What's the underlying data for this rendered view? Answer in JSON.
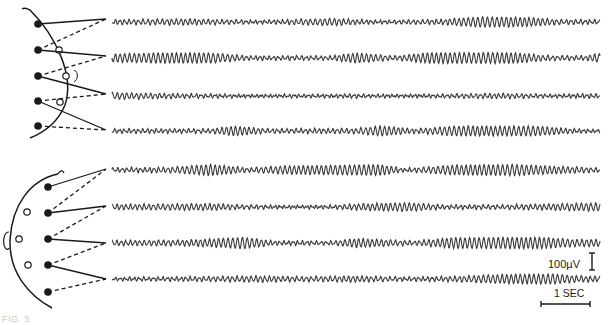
{
  "figure": {
    "panels": [
      {
        "id": "sagittal-montage",
        "view": "side profile",
        "active_electrodes": 5,
        "reference_electrodes": 3,
        "channels": [
          {
            "index": 1,
            "envelope": [
              [
                0,
                0.35
              ],
              [
                0.15,
                0.5
              ],
              [
                0.3,
                0.2
              ],
              [
                0.45,
                0.6
              ],
              [
                0.55,
                0.2
              ],
              [
                0.68,
                0.4
              ],
              [
                0.75,
                0.9
              ],
              [
                0.85,
                0.8
              ],
              [
                0.92,
                0.35
              ],
              [
                1,
                0.3
              ]
            ]
          },
          {
            "index": 2,
            "envelope": [
              [
                0,
                0.7
              ],
              [
                0.1,
                0.9
              ],
              [
                0.2,
                0.9
              ],
              [
                0.28,
                0.3
              ],
              [
                0.45,
                0.3
              ],
              [
                0.5,
                0.9
              ],
              [
                0.58,
                0.3
              ],
              [
                0.65,
                0.95
              ],
              [
                0.82,
                0.95
              ],
              [
                0.9,
                0.35
              ],
              [
                0.97,
                0.35
              ],
              [
                1,
                0.8
              ]
            ]
          },
          {
            "index": 3,
            "envelope": [
              [
                0,
                0.55
              ],
              [
                0.15,
                0.3
              ],
              [
                0.3,
                0.15
              ],
              [
                0.5,
                0.25
              ],
              [
                0.6,
                0.15
              ],
              [
                0.8,
                0.4
              ],
              [
                0.9,
                0.2
              ],
              [
                1,
                0.3
              ]
            ]
          },
          {
            "index": 4,
            "envelope": [
              [
                0,
                0.3
              ],
              [
                0.2,
                0.3
              ],
              [
                0.25,
                0.85
              ],
              [
                0.32,
                0.3
              ],
              [
                0.5,
                0.4
              ],
              [
                0.55,
                0.9
              ],
              [
                0.62,
                0.3
              ],
              [
                0.7,
                0.85
              ],
              [
                0.87,
                0.85
              ],
              [
                0.95,
                0.3
              ],
              [
                1,
                0.2
              ]
            ]
          }
        ]
      },
      {
        "id": "coronal-montage",
        "view": "head with ear",
        "active_electrodes": 5,
        "reference_electrodes": 3,
        "channels": [
          {
            "index": 5,
            "envelope": [
              [
                0,
                0.3
              ],
              [
                0.12,
                0.4
              ],
              [
                0.2,
                1.0
              ],
              [
                0.28,
                0.3
              ],
              [
                0.35,
                0.7
              ],
              [
                0.55,
                0.95
              ],
              [
                0.6,
                0.2
              ],
              [
                0.7,
                0.85
              ],
              [
                0.82,
                1.0
              ],
              [
                0.92,
                0.6
              ],
              [
                1,
                0.3
              ]
            ]
          },
          {
            "index": 6,
            "envelope": [
              [
                0,
                0.4
              ],
              [
                0.2,
                0.55
              ],
              [
                0.27,
                0.3
              ],
              [
                0.38,
                0.15
              ],
              [
                0.45,
                0.2
              ],
              [
                0.5,
                0.5
              ],
              [
                0.6,
                0.75
              ],
              [
                0.68,
                0.3
              ],
              [
                0.8,
                0.3
              ],
              [
                0.9,
                0.5
              ],
              [
                1,
                0.7
              ]
            ]
          },
          {
            "index": 7,
            "envelope": [
              [
                0,
                0.4
              ],
              [
                0.15,
                0.45
              ],
              [
                0.27,
                1.0
              ],
              [
                0.33,
                0.3
              ],
              [
                0.45,
                0.25
              ],
              [
                0.5,
                0.8
              ],
              [
                0.55,
                0.55
              ],
              [
                0.62,
                0.3
              ],
              [
                0.7,
                0.95
              ],
              [
                0.88,
                1.0
              ],
              [
                0.95,
                0.6
              ],
              [
                1,
                0.6
              ]
            ]
          },
          {
            "index": 8,
            "envelope": [
              [
                0,
                0.2
              ],
              [
                0.2,
                0.35
              ],
              [
                0.3,
                0.5
              ],
              [
                0.4,
                0.35
              ],
              [
                0.5,
                0.5
              ],
              [
                0.6,
                0.25
              ],
              [
                0.7,
                0.4
              ],
              [
                0.78,
                0.75
              ],
              [
                0.9,
                0.9
              ],
              [
                0.95,
                0.55
              ],
              [
                1,
                0.4
              ]
            ]
          }
        ]
      }
    ],
    "calibration": {
      "amplitude_label": "100µV",
      "amplitude_value_uv": 100,
      "time_label": "1 SEC",
      "time_value_s": 1
    },
    "caption_fragment": "FIG. 5"
  },
  "colors": {
    "ink": "#1a1a1a",
    "trace": "#3a3a3a",
    "background": "#ffffff"
  }
}
